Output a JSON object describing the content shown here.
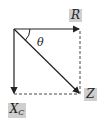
{
  "diagram": {
    "type": "phasor-diagram",
    "labels": {
      "R": "R",
      "Z": "Z",
      "Xc_main": "X",
      "Xc_sub": "C",
      "angle": "θ"
    },
    "colors": {
      "line": "#222222",
      "label_bg": "#cfcfcf"
    },
    "vectors": [
      {
        "name": "R",
        "from": [
          14,
          29
        ],
        "to": [
          80,
          29
        ],
        "style": "solid-arrow"
      },
      {
        "name": "Xc",
        "from": [
          14,
          29
        ],
        "to": [
          14,
          94
        ],
        "style": "solid-arrow"
      },
      {
        "name": "Z",
        "from": [
          14,
          29
        ],
        "to": [
          80,
          94
        ],
        "style": "solid-arrow"
      },
      {
        "name": "R-projection",
        "from": [
          80,
          29
        ],
        "to": [
          80,
          94
        ],
        "style": "dashed"
      },
      {
        "name": "Xc-projection",
        "from": [
          14,
          94
        ],
        "to": [
          80,
          94
        ],
        "style": "dashed"
      }
    ]
  }
}
